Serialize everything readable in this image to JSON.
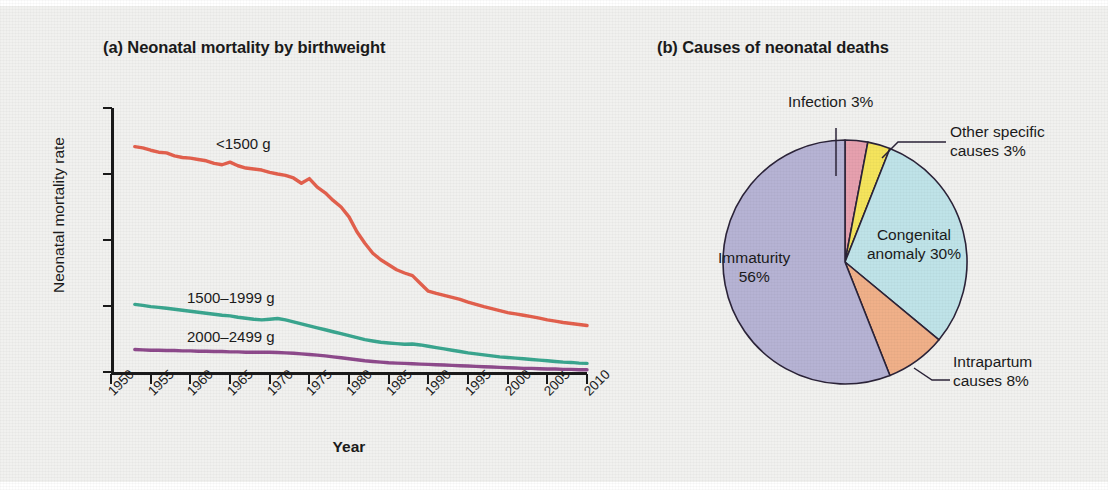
{
  "figure": {
    "panel_a_title": "(a) Neonatal mortality by birthweight",
    "panel_b_title": "(b) Causes of neonatal deaths"
  },
  "chart_data": [
    {
      "type": "line",
      "title": "(a) Neonatal mortality by birthweight",
      "xlabel": "Year",
      "ylabel": "Neonatal mortality rate",
      "xlim": [
        1950,
        2010
      ],
      "ylim": [
        0,
        800
      ],
      "yticks": [
        0,
        200,
        400,
        600,
        800
      ],
      "xticks": [
        1950,
        1955,
        1960,
        1965,
        1970,
        1975,
        1980,
        1985,
        1990,
        1995,
        2000,
        2005,
        2010
      ],
      "grid": false,
      "legend": "inline-labels",
      "x": [
        1953,
        1954,
        1955,
        1956,
        1957,
        1958,
        1959,
        1960,
        1961,
        1962,
        1963,
        1964,
        1965,
        1966,
        1967,
        1968,
        1969,
        1970,
        1971,
        1972,
        1973,
        1974,
        1975,
        1976,
        1977,
        1978,
        1979,
        1980,
        1981,
        1982,
        1983,
        1984,
        1985,
        1986,
        1987,
        1988,
        1989,
        1990,
        1991,
        1992,
        1993,
        1994,
        1995,
        1996,
        1997,
        1998,
        1999,
        2000,
        2001,
        2002,
        2003,
        2004,
        2005,
        2006,
        2007,
        2008,
        2009,
        2010
      ],
      "series": [
        {
          "name": "<1500 g",
          "color": "#e3604d",
          "values": [
            683,
            679,
            672,
            666,
            664,
            655,
            650,
            648,
            644,
            640,
            632,
            628,
            636,
            625,
            618,
            615,
            612,
            605,
            600,
            596,
            588,
            572,
            586,
            560,
            543,
            520,
            500,
            470,
            425,
            390,
            360,
            340,
            325,
            310,
            300,
            292,
            268,
            245,
            238,
            232,
            226,
            220,
            212,
            205,
            198,
            192,
            186,
            180,
            176,
            172,
            168,
            163,
            158,
            154,
            150,
            147,
            144,
            141
          ]
        },
        {
          "name": "1500–1999 g",
          "color": "#3aa68f",
          "values": [
            205,
            202,
            198,
            196,
            193,
            190,
            187,
            184,
            181,
            178,
            175,
            172,
            170,
            166,
            163,
            160,
            158,
            160,
            162,
            158,
            152,
            146,
            140,
            134,
            128,
            122,
            116,
            110,
            104,
            98,
            94,
            90,
            88,
            86,
            84,
            85,
            82,
            78,
            74,
            70,
            66,
            62,
            58,
            55,
            52,
            49,
            46,
            44,
            42,
            40,
            38,
            36,
            34,
            32,
            30,
            29,
            27,
            26
          ]
        },
        {
          "name": "2000–2499 g",
          "color": "#8e4a8c",
          "values": [
            68,
            67,
            66,
            66,
            65,
            65,
            64,
            64,
            63,
            63,
            62,
            62,
            61,
            61,
            60,
            60,
            60,
            60,
            59,
            58,
            57,
            55,
            53,
            51,
            49,
            46,
            43,
            40,
            37,
            34,
            32,
            30,
            28,
            27,
            26,
            25,
            24,
            23,
            22,
            21,
            20,
            19,
            18,
            17,
            16,
            15,
            14,
            13,
            12,
            11,
            11,
            10,
            9,
            9,
            8,
            8,
            7,
            7
          ]
        }
      ]
    },
    {
      "type": "pie",
      "title": "(b) Causes of neonatal deaths",
      "labels": [
        "Infection",
        "Other specific causes",
        "Congenital anomaly",
        "Intrapartum causes",
        "Immaturity"
      ],
      "values": [
        3,
        3,
        30,
        8,
        56
      ],
      "colors": [
        "#e6a0ae",
        "#f5e45c",
        "#bfe3e8",
        "#f0b089",
        "#b6b3d4"
      ],
      "label_texts": {
        "infection": "Infection 3%",
        "other_line1": "Other specific",
        "other_line2": "causes 3%",
        "congenital_line1": "Congenital",
        "congenital_line2": "anomaly 30%",
        "intrapartum_line1": "Intrapartum",
        "intrapartum_line2": "causes 8%",
        "immaturity_line1": "Immaturity",
        "immaturity_line2": "56%"
      }
    }
  ],
  "line_chart_labels": {
    "ylabel": "Neonatal mortality rate",
    "xlabel": "Year",
    "yticks": [
      "800",
      "600",
      "400",
      "200",
      "0"
    ],
    "xticks": [
      "1950",
      "1955",
      "1960",
      "1965",
      "1970",
      "1975",
      "1980",
      "1985",
      "1990",
      "1995",
      "2000",
      "2005",
      "2010"
    ],
    "series_names": [
      "<1500 g",
      "1500–1999 g",
      "2000–2499 g"
    ]
  }
}
